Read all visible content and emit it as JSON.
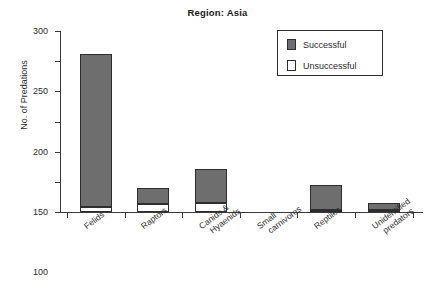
{
  "chart_data": {
    "type": "bar",
    "title": "Region: Asia",
    "xlabel": "",
    "ylabel": "No. of Predations",
    "ylim": [
      0,
      300
    ],
    "yticks": [
      0,
      50,
      100,
      150,
      200,
      250,
      300
    ],
    "grid": false,
    "stacked": true,
    "legend_position": "top-right",
    "categories": [
      "Felids",
      "Raptors",
      "Canids &\nHyaenids",
      "Small\ncarnivores",
      "Reptiles",
      "Unidentified\npredators"
    ],
    "series": [
      {
        "name": "Unsuccessful",
        "color": "#ffffff",
        "values": [
          8,
          14,
          15,
          0,
          3,
          1
        ]
      },
      {
        "name": "Successful",
        "color": "#6e6e6e",
        "values": [
          254,
          26,
          57,
          0,
          42,
          12
        ]
      }
    ],
    "totals": [
      262,
      40,
      72,
      0,
      45,
      13
    ]
  },
  "legend": {
    "entries": [
      {
        "label": "Successful",
        "swatch": "#6e6e6e"
      },
      {
        "label": "Unsuccessful",
        "swatch": "#ffffff"
      }
    ]
  }
}
